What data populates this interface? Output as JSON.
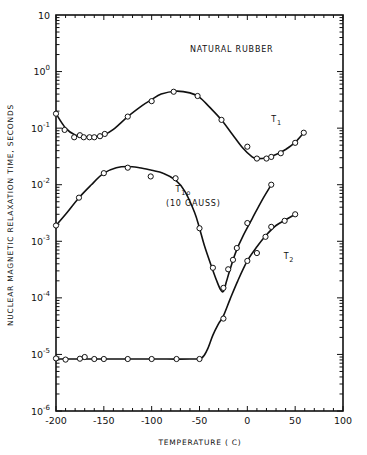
{
  "chart_data": {
    "type": "scatter",
    "title": "",
    "xlabel": "TEMPERATURE ( C)",
    "ylabel": "NUCLEAR MAGNETIC RELAXATION TIME, SECONDS",
    "xlim": [
      -200,
      100
    ],
    "ylim": [
      1e-06,
      10
    ],
    "yscale": "log",
    "grid": false,
    "x_ticks": [
      -200,
      -150,
      -100,
      -50,
      0,
      50,
      100
    ],
    "x_tick_labels": [
      "-200",
      "-150",
      "-100",
      "-50",
      "0",
      "50",
      "100"
    ],
    "y_ticks": [
      {
        "value": 10,
        "base": "10",
        "exp": ""
      },
      {
        "value": 1,
        "base": "10",
        "exp": "0"
      },
      {
        "value": 0.1,
        "base": "10",
        "exp": "-1"
      },
      {
        "value": 0.01,
        "base": "10",
        "exp": "-2"
      },
      {
        "value": 0.001,
        "base": "10",
        "exp": "-3"
      },
      {
        "value": 0.0001,
        "base": "10",
        "exp": "-4"
      },
      {
        "value": 1e-05,
        "base": "10",
        "exp": "-5"
      },
      {
        "value": 1e-06,
        "base": "10",
        "exp": "-6"
      }
    ],
    "annotations": [
      {
        "text": "NATURAL RUBBER",
        "x": -60,
        "y": 2.2
      },
      {
        "text": "T",
        "sub": "1",
        "x": 25,
        "y": 0.13,
        "series": "T1"
      },
      {
        "text": "T",
        "sub": "1ρ",
        "x": -75,
        "y": 0.0075,
        "series": "T1rho"
      },
      {
        "text": "(10 GAUSS)",
        "x": -85,
        "y": 0.0042,
        "series": "T1rho"
      },
      {
        "text": "T",
        "sub": "2",
        "x": 38,
        "y": 0.00048,
        "series": "T2"
      }
    ],
    "series": [
      {
        "name": "T1",
        "x": [
          -200,
          -191,
          -181,
          -175,
          -171,
          -165,
          -160,
          -154,
          -149,
          -125,
          -100,
          -77,
          -52,
          -27,
          0,
          10,
          20,
          25,
          35,
          50,
          59
        ],
        "y": [
          0.18,
          0.093,
          0.069,
          0.075,
          0.069,
          0.069,
          0.069,
          0.072,
          0.079,
          0.16,
          0.3,
          0.44,
          0.37,
          0.14,
          0.047,
          0.029,
          0.029,
          0.031,
          0.036,
          0.055,
          0.083
        ],
        "curve_x": [
          -200,
          -190,
          -180,
          -170,
          -160,
          -150,
          -140,
          -125,
          -110,
          -100,
          -90,
          -75,
          -60,
          -50,
          -40,
          -27,
          -15,
          -5,
          5,
          10,
          20,
          30,
          40,
          50,
          59
        ],
        "curve_y": [
          0.18,
          0.1,
          0.076,
          0.07,
          0.07,
          0.076,
          0.095,
          0.16,
          0.25,
          0.32,
          0.4,
          0.45,
          0.42,
          0.35,
          0.24,
          0.14,
          0.075,
          0.045,
          0.031,
          0.029,
          0.03,
          0.034,
          0.042,
          0.056,
          0.083
        ]
      },
      {
        "name": "T1rho (10 gauss)",
        "x": [
          -200,
          -176,
          -150,
          -125,
          -101,
          -75,
          -50,
          -36,
          -25,
          -20,
          -15,
          -11,
          0,
          25
        ],
        "y": [
          0.0019,
          0.0059,
          0.016,
          0.02,
          0.014,
          0.013,
          0.0017,
          0.00034,
          0.00015,
          0.00032,
          0.00047,
          0.00076,
          0.0021,
          0.01
        ],
        "curve_x": [
          -200,
          -188,
          -176,
          -163,
          -150,
          -137,
          -125,
          -113,
          -100,
          -88,
          -75,
          -65,
          -55,
          -50,
          -45,
          -38,
          -32,
          -28,
          -25,
          -22,
          -18,
          -12,
          -5,
          5,
          15,
          25
        ],
        "curve_y": [
          0.0019,
          0.0033,
          0.0059,
          0.01,
          0.016,
          0.02,
          0.021,
          0.02,
          0.018,
          0.016,
          0.012,
          0.0075,
          0.0032,
          0.0017,
          0.00085,
          0.00038,
          0.0002,
          0.00014,
          0.00013,
          0.00019,
          0.00032,
          0.00065,
          0.0012,
          0.0025,
          0.0052,
          0.01
        ]
      },
      {
        "name": "T2",
        "x": [
          -200,
          -190,
          -175,
          -170,
          -160,
          -150,
          -125,
          -100,
          -74,
          -50,
          -25,
          0,
          10,
          19,
          25,
          39,
          50
        ],
        "y": [
          8.5e-06,
          8.1e-06,
          8.4e-06,
          9e-06,
          8.3e-06,
          8.3e-06,
          8.3e-06,
          8.3e-06,
          8.3e-06,
          8.3e-06,
          4.3e-05,
          0.00045,
          0.00062,
          0.0012,
          0.0018,
          0.0023,
          0.003
        ],
        "curve_x": [
          -200,
          -150,
          -100,
          -60,
          -48,
          -42,
          -36,
          -30,
          -25,
          -18,
          -10,
          0,
          10,
          20,
          30,
          40,
          50
        ],
        "curve_y": [
          8.3e-06,
          8.3e-06,
          8.3e-06,
          8.3e-06,
          8.6e-06,
          1.2e-05,
          2.2e-05,
          3.5e-05,
          4.8e-05,
          9.5e-05,
          0.0002,
          0.00045,
          0.0008,
          0.0013,
          0.0019,
          0.0024,
          0.003
        ]
      }
    ]
  }
}
